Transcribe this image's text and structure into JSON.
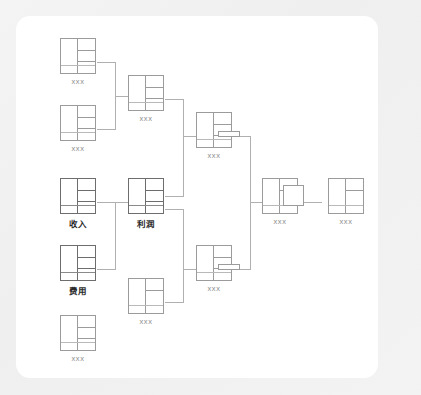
{
  "canvas": {
    "background": "#f2f2f2",
    "card_background": "#ffffff",
    "line_color": "#9b9b9b",
    "connector_color": "#b0b0b0",
    "label_color": "#8d8d8d",
    "highlight_label_color": "#2b2b2b"
  },
  "diagram": {
    "type": "flow-lineage",
    "title": "",
    "node_count": 11,
    "nodes": [
      {
        "id": "n1",
        "label": "xxx",
        "kind": "table-node",
        "column": 1,
        "x": 60,
        "y": 38
      },
      {
        "id": "n2",
        "label": "xxx",
        "kind": "table-node",
        "column": 1,
        "x": 60,
        "y": 105
      },
      {
        "id": "n3",
        "label": "收入",
        "kind": "table-node-highlight",
        "column": 1,
        "x": 60,
        "y": 178
      },
      {
        "id": "n4",
        "label": "费用",
        "kind": "table-node-highlight",
        "column": 1,
        "x": 60,
        "y": 245
      },
      {
        "id": "n5",
        "label": "xxx",
        "kind": "table-node",
        "column": 1,
        "x": 60,
        "y": 315
      },
      {
        "id": "n6",
        "label": "xxx",
        "kind": "table-node",
        "column": 2,
        "x": 128,
        "y": 75
      },
      {
        "id": "n7",
        "label": "利润",
        "kind": "table-node-highlight",
        "column": 2,
        "x": 128,
        "y": 178
      },
      {
        "id": "n8",
        "label": "xxx",
        "kind": "table-node",
        "column": 2,
        "x": 128,
        "y": 278
      },
      {
        "id": "n9",
        "label": "xxx",
        "kind": "table-node-with-bar",
        "column": 3,
        "x": 196,
        "y": 112
      },
      {
        "id": "n10",
        "label": "xxx",
        "kind": "table-node-with-bar",
        "column": 3,
        "x": 196,
        "y": 245
      },
      {
        "id": "n11",
        "label": "xxx",
        "kind": "table-node-with-square",
        "column": 4,
        "x": 262,
        "y": 178
      },
      {
        "id": "n12",
        "label": "xxx",
        "kind": "table-node",
        "column": 5,
        "x": 328,
        "y": 178
      }
    ],
    "edges": [
      {
        "from": [
          "n1",
          "n2"
        ],
        "to": "n6"
      },
      {
        "from": [
          "n3",
          "n4"
        ],
        "to": "n7"
      },
      {
        "from": [
          "n6",
          "n7"
        ],
        "to": "n9"
      },
      {
        "from": [
          "n7",
          "n8"
        ],
        "to": "n10"
      },
      {
        "from": [
          "n9",
          "n10"
        ],
        "to": "n11"
      },
      {
        "from": [
          "n11"
        ],
        "to": "n12"
      }
    ]
  }
}
